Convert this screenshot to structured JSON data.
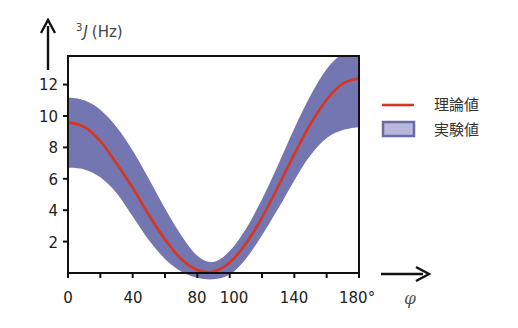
{
  "chart_data": {
    "type": "line",
    "title": "",
    "xlabel": "φ",
    "ylabel": "³J (Hz)",
    "ylabel_parts": {
      "superscript": "3",
      "symbol": "J",
      "unit": "(Hz)"
    },
    "x_ticks": [
      0,
      40,
      80,
      100,
      140,
      180
    ],
    "x_tick_labels": [
      "0",
      "40",
      "80",
      "100",
      "140",
      "180°"
    ],
    "x_minor_ticks": [
      20,
      60,
      120,
      160
    ],
    "y_ticks": [
      2,
      4,
      6,
      8,
      10,
      12
    ],
    "y_tick_labels": [
      "2",
      "4",
      "6",
      "8",
      "10",
      "12"
    ],
    "xlim": [
      0,
      180
    ],
    "ylim": [
      0,
      13.85
    ],
    "grid": false,
    "legend_position": "right",
    "karplus_fit": {
      "A": 10.9,
      "B": -1.4,
      "C": 0.1,
      "formula": "J = A cos²φ + B cosφ + C"
    },
    "x": [
      0,
      10,
      20,
      30,
      40,
      50,
      60,
      70,
      80,
      90,
      100,
      110,
      120,
      130,
      140,
      150,
      160,
      170,
      180
    ],
    "series": [
      {
        "name": "理論値",
        "kind": "line",
        "color": "#d9361f",
        "values": [
          9.6,
          9.31,
          8.41,
          6.98,
          5.43,
          3.7,
          2.13,
          0.89,
          0.19,
          0.1,
          0.67,
          1.86,
          3.53,
          5.51,
          7.57,
          9.49,
          11.04,
          12.06,
          12.4
        ]
      },
      {
        "name": "実験値",
        "kind": "band",
        "color": "#7376b0",
        "upper": [
          11.2,
          11.0,
          10.4,
          9.3,
          7.8,
          6.0,
          4.1,
          2.4,
          1.1,
          0.7,
          1.4,
          2.8,
          4.7,
          6.9,
          9.2,
          11.3,
          13.0,
          14.0,
          14.5
        ],
        "lower": [
          6.7,
          6.6,
          6.1,
          5.1,
          3.6,
          2.1,
          0.9,
          0.1,
          -0.3,
          -0.4,
          -0.1,
          0.9,
          2.4,
          4.1,
          5.9,
          7.5,
          8.6,
          9.1,
          9.3
        ]
      }
    ]
  },
  "legend": {
    "items": [
      {
        "label": "理論値",
        "swatch": "line",
        "color": "#d9361f"
      },
      {
        "label": "実験値",
        "swatch": "box",
        "fill": "#b7b8dc",
        "border": "#6a6ca8"
      }
    ]
  },
  "colors": {
    "axis": "#111111",
    "theory_line": "#d9361f",
    "experiment_band": "#7376b0"
  }
}
